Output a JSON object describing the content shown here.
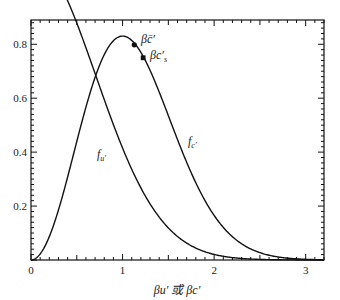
{
  "chart_data": {
    "type": "line",
    "title": "",
    "xlabel": "βu′ 或 βc′",
    "ylabel": "",
    "xlim": [
      0,
      3.2
    ],
    "ylim": [
      0,
      0.89
    ],
    "grid": false,
    "x_ticks": [
      0,
      1,
      2,
      3
    ],
    "x_tick_labels": [
      "0",
      "1",
      "2",
      "3"
    ],
    "y_ticks": [
      0.2,
      0.4,
      0.6,
      0.8
    ],
    "y_tick_labels": [
      "0.2",
      "0.4",
      "0.6",
      "0.8"
    ],
    "series": [
      {
        "name": "f_u'",
        "label": "f",
        "subscript": "u′",
        "formula": "2/sqrt(pi) * exp(-x^2)",
        "x": [
          0,
          0.2,
          0.4,
          0.6,
          0.8,
          1.0,
          1.2,
          1.4,
          1.6,
          1.8,
          2.0,
          2.2,
          2.4,
          2.6,
          2.8,
          3.0,
          3.2
        ],
        "values": [
          0.564,
          0.542,
          0.481,
          0.394,
          0.297,
          0.208,
          0.133,
          0.079,
          0.044,
          0.022,
          0.01,
          0.004,
          0.002,
          0.001,
          0.0,
          0.0,
          0.0
        ]
      },
      {
        "name": "f_c'",
        "label": "f",
        "subscript": "c′",
        "formula": "4/sqrt(pi) * x^2 * exp(-x^2)",
        "x": [
          0,
          0.2,
          0.4,
          0.6,
          0.8,
          1.0,
          1.2,
          1.4,
          1.6,
          1.8,
          2.0,
          2.2,
          2.4,
          2.6,
          2.8,
          3.0,
          3.2
        ],
        "values": [
          0.0,
          0.087,
          0.308,
          0.567,
          0.76,
          0.83,
          0.764,
          0.617,
          0.443,
          0.285,
          0.165,
          0.086,
          0.041,
          0.018,
          0.007,
          0.002,
          0.001
        ]
      }
    ],
    "annotations": [
      {
        "text": "βc̄′",
        "x": 1.128,
        "y": 0.798,
        "marker": "circle"
      },
      {
        "text": "βc′ₛ",
        "x": 1.225,
        "y": 0.75,
        "marker": "square"
      }
    ],
    "legend_position": "none"
  },
  "labels": {
    "f_u_main": "f",
    "f_u_sub": "u′",
    "f_c_main": "f",
    "f_c_sub": "c′",
    "ann_mean": "βc̄′",
    "ann_s_main": "βc′",
    "ann_s_sub": "s",
    "xlabel": "βu′ 或 βc′"
  }
}
